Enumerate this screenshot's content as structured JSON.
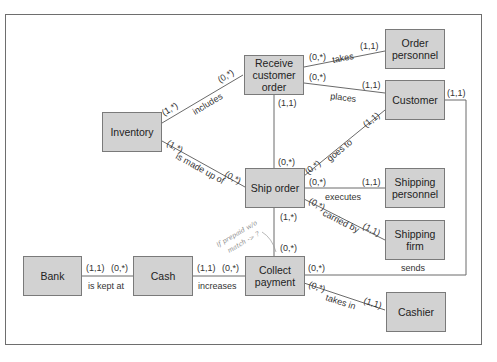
{
  "diagram": {
    "type": "entity-relationship (REA) diagram",
    "entities": [
      {
        "id": "inventory",
        "label": "Inventory"
      },
      {
        "id": "receive_customer_order",
        "label": "Receive customer order"
      },
      {
        "id": "order_personnel",
        "label": "Order personnel"
      },
      {
        "id": "customer",
        "label": "Customer"
      },
      {
        "id": "ship_order",
        "label": "Ship order"
      },
      {
        "id": "shipping_personnel",
        "label": "Shipping personnel"
      },
      {
        "id": "shipping_firm",
        "label": "Shipping firm"
      },
      {
        "id": "bank",
        "label": "Bank"
      },
      {
        "id": "cash",
        "label": "Cash"
      },
      {
        "id": "collect_payment",
        "label": "Collect payment"
      },
      {
        "id": "cashier",
        "label": "Cashier"
      }
    ],
    "relationships": [
      {
        "label": "includes",
        "from": "Inventory",
        "to": "Receive customer order",
        "from_card": "(1,*)",
        "to_card": "(0,*)"
      },
      {
        "label": "is made up of",
        "from": "Inventory",
        "to": "Ship order",
        "from_card": "(1,*)",
        "to_card": "(0,*)"
      },
      {
        "label": "takes",
        "from": "Receive customer order",
        "to": "Order personnel",
        "from_card": "(0,*)",
        "to_card": "(1,1)"
      },
      {
        "label": "places",
        "from": "Receive customer order",
        "to": "Customer",
        "from_card": "(0,*)",
        "to_card": "(1,1)"
      },
      {
        "label": "",
        "from": "Receive customer order",
        "to": "Ship order",
        "from_card": "(1,1)",
        "to_card": "(0,*)"
      },
      {
        "label": "goes to",
        "from": "Ship order",
        "to": "Customer",
        "from_card": "(0,*)",
        "to_card": "(1,1)"
      },
      {
        "label": "executes",
        "from": "Ship order",
        "to": "Shipping personnel",
        "from_card": "(0,*)",
        "to_card": "(1,1)"
      },
      {
        "label": "carried by",
        "from": "Ship order",
        "to": "Shipping firm",
        "from_card": "(0,*)",
        "to_card": "(1,1)"
      },
      {
        "label": "",
        "from": "Ship order",
        "to": "Collect payment",
        "from_card": "(1,*)",
        "to_card": "(0,*)"
      },
      {
        "label": "is kept at",
        "from": "Bank",
        "to": "Cash",
        "from_card": "(1,1)",
        "to_card": "(0,*)"
      },
      {
        "label": "increases",
        "from": "Cash",
        "to": "Collect payment",
        "from_card": "(1,1)",
        "to_card": "(0,*)"
      },
      {
        "label": "sends",
        "from": "Collect payment",
        "to": "Customer",
        "from_card": "(0,*)",
        "to_card": "(1,1)"
      },
      {
        "label": "takes in",
        "from": "Collect payment",
        "to": "Cashier",
        "from_card": "(0,*)",
        "to_card": "(1,1)"
      }
    ],
    "handwritten_note": [
      "if prepaid w/o",
      "match -> ?"
    ]
  },
  "labels": {
    "inv": "Inventory",
    "rco": [
      "Receive",
      "customer",
      "order"
    ],
    "op": [
      "Order",
      "personnel"
    ],
    "cust": "Customer",
    "ship": "Ship order",
    "sp": [
      "Shipping",
      "personnel"
    ],
    "sf": [
      "Shipping",
      "firm"
    ],
    "bank": "Bank",
    "cash": "Cash",
    "cp": [
      "Collect",
      "payment"
    ],
    "cashier": "Cashier"
  },
  "cards": {
    "c01": "(1,*)",
    "c02": "(0,*)",
    "c03": "(1,*)",
    "c04": "(0,*)",
    "c05": "(0,*)",
    "c06": "(1,1)",
    "c07": "(0,*)",
    "c08": "(1,1)",
    "c09": "(1,1)",
    "c10": "(0,*)",
    "c11": "(0,*)",
    "c12": "(1,1)",
    "c13": "(0,*)",
    "c14": "(1,1)",
    "c15": "(0,*)",
    "c16": "(1,1)",
    "c17": "(1,*)",
    "c18": "(0,*)",
    "c19": "(1,1)",
    "c20": "(0,*)",
    "c21": "(1,1)",
    "c22": "(0,*)",
    "c23": "(0,*)",
    "c24": "(1,1)",
    "c25": "(0,*)",
    "c26": "(1,1)"
  },
  "rels": {
    "includes": "includes",
    "made": "is made up of",
    "takes": "takes",
    "places": "places",
    "goes": "goes to",
    "executes": "executes",
    "carried": "carried by",
    "kept": "is kept at",
    "increases": "increases",
    "sends": "sends",
    "takesin": "takes in"
  },
  "note": {
    "l1": "if prepaid w/o",
    "l2": "match -> ?"
  }
}
